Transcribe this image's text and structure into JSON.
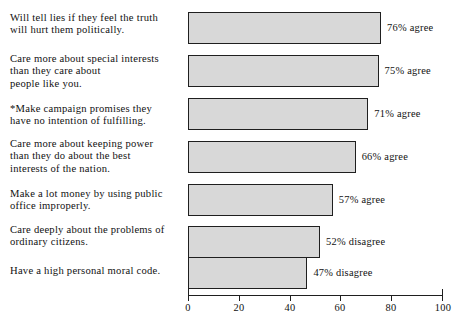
{
  "chart_data": {
    "type": "bar",
    "orientation": "horizontal",
    "title": "",
    "subtitle": "",
    "xlabel": "",
    "ylabel": "",
    "xlim": [
      0,
      100
    ],
    "xticks": [
      0,
      20,
      40,
      60,
      80,
      100
    ],
    "xtick_labels": [
      "0",
      "20",
      "40",
      "60",
      "80",
      "100"
    ],
    "grid": false,
    "legend": "none",
    "bar_fill_color": "#d8d8d8",
    "bar_edge_color": "#1f1f1f",
    "categories": [
      "Will tell lies if they feel the truth\nwill hurt them politically.",
      "Care more about special interests\nthan they care about\npeople like you.",
      "*Make campaign promises they\n have no intention of fulfilling.",
      "Care more about keeping power\nthan they do about the best\ninterests of the nation.",
      "Make a lot money by using public\noffice improperly.",
      "Care deeply about the problems of\nordinary citizens.",
      "Have a high personal moral code."
    ],
    "values": [
      76,
      75,
      71,
      66,
      57,
      52,
      47
    ],
    "data_labels": [
      "76% agree",
      "75% agree",
      "71% agree",
      "66% agree",
      "57% agree",
      "52% disagree",
      "47% disagree"
    ],
    "responses": [
      "agree",
      "agree",
      "agree",
      "agree",
      "agree",
      "disagree",
      "disagree"
    ],
    "annotations": [
      "* indicates asterisked item"
    ]
  }
}
